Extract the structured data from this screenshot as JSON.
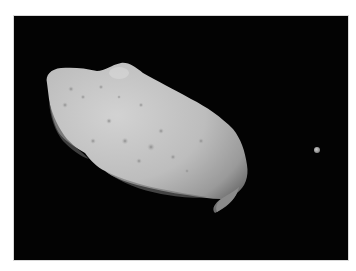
{
  "image": {
    "subject": "Asteroid with small moon",
    "background_color": "#030303",
    "page_background": "#ffffff",
    "asteroid_color": "#bcbcbc",
    "moon_color": "#b0b0b0"
  }
}
